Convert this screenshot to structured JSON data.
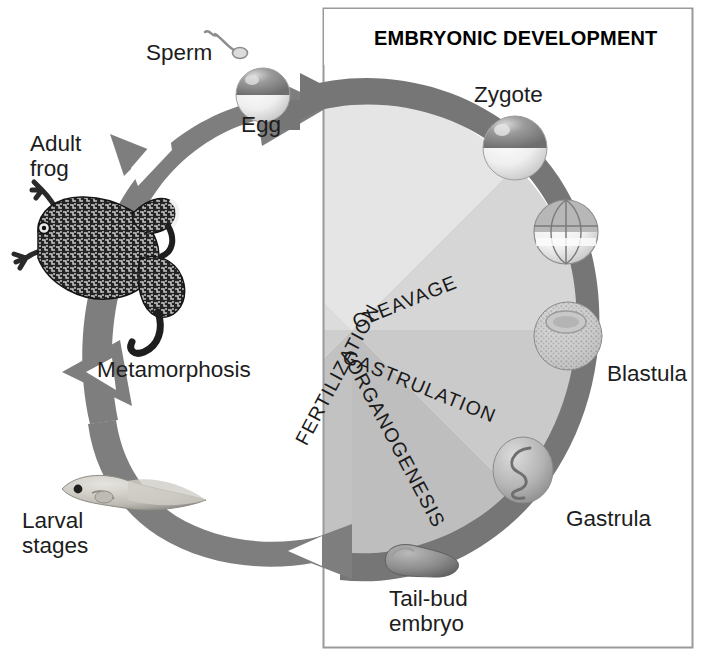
{
  "diagram": {
    "panel_title": "EMBRYONIC DEVELOPMENT"
  },
  "panel": {
    "title": "EMBRYONIC DEVELOPMENT",
    "border_color": "#9a9a9a",
    "background": "#ffffff"
  },
  "colors": {
    "arrow": "#7e7e7e",
    "arrow_dark": "#6d6d6d",
    "wedge_fertilization": "#e3e3e3",
    "wedge_cleavage": "#d4d4d4",
    "wedge_gastrulation": "#c9c9c9",
    "wedge_organogenesis": "#bdbdbd",
    "text": "#1d1d1d",
    "egg_animal_pole": "#8f8f8f",
    "egg_vegetal_pole": "#f2f2f2",
    "frog_body": "#2a2a2a"
  },
  "cycle_labels": [
    {
      "id": "adult-frog",
      "text": "Adult\nfrog",
      "x": 30,
      "y": 131
    },
    {
      "id": "sperm",
      "text": "Sperm",
      "x": 146,
      "y": 40
    },
    {
      "id": "egg",
      "text": "Egg",
      "x": 241,
      "y": 112
    },
    {
      "id": "metamorphosis",
      "text": "Metamorphosis",
      "x": 97,
      "y": 357
    },
    {
      "id": "larval-stages",
      "text": "Larval\nstages",
      "x": 22,
      "y": 508
    }
  ],
  "stage_labels": [
    {
      "id": "zygote",
      "text": "Zygote",
      "x": 474,
      "y": 82
    },
    {
      "id": "blastula",
      "text": "Blastula",
      "x": 607,
      "y": 361
    },
    {
      "id": "gastrula",
      "text": "Gastrula",
      "x": 566,
      "y": 506
    },
    {
      "id": "tail-bud-embryo",
      "text": "Tail-bud\nembryo",
      "x": 389,
      "y": 586
    }
  ],
  "wedges": [
    {
      "id": "fertilization",
      "label": "FERTILIZATION",
      "angle": -62,
      "x": 364,
      "y": 300,
      "fill": "#e3e3e3"
    },
    {
      "id": "cleavage",
      "label": "CLEAVAGE",
      "angle": -22,
      "x": 349,
      "y": 312,
      "fill": "#d4d4d4"
    },
    {
      "id": "gastrulation",
      "label": "GASTRULATION",
      "angle": 22,
      "x": 348,
      "y": 345,
      "fill": "#c9c9c9"
    },
    {
      "id": "organogenesis",
      "label": "ORGANOGENESIS",
      "angle": 62,
      "x": 362,
      "y": 355,
      "fill": "#bdbdbd"
    }
  ],
  "illustrations": [
    {
      "id": "sperm",
      "name": "sperm-illustration"
    },
    {
      "id": "egg",
      "name": "egg-illustration"
    },
    {
      "id": "adult-frog",
      "name": "adult-frog-illustration"
    },
    {
      "id": "tadpole",
      "name": "tadpole-illustration"
    },
    {
      "id": "zygote",
      "name": "zygote-illustration"
    },
    {
      "id": "cleavage-embryo",
      "name": "cleavage-embryo-illustration"
    },
    {
      "id": "blastula",
      "name": "blastula-illustration"
    },
    {
      "id": "gastrula",
      "name": "gastrula-illustration"
    },
    {
      "id": "tail-bud-embryo",
      "name": "tail-bud-embryo-illustration"
    }
  ],
  "arrows": {
    "direction": "clockwise-from-adult-frog-through-egg",
    "count": 4
  }
}
